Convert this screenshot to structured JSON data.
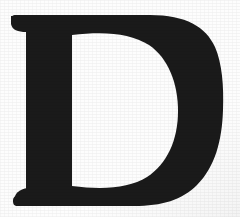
{
  "image": {
    "kind": "scanned-drop-cap",
    "character": "D",
    "description": "Large black serif capital letter D on a white page",
    "width": 240,
    "height": 217
  },
  "colors": {
    "ink": "#1a1a1a",
    "ink_edge": "#2a2a2a",
    "paper": "#fdfdfd",
    "paper_edge": "#f4f4f4"
  },
  "glyph": {
    "letter": "D",
    "style": "didone-serif-drop-cap",
    "stem": {
      "left": 26,
      "right": 72,
      "width": 46
    },
    "top_arm": {
      "top": 14,
      "left": 11,
      "right": 186
    },
    "bottom_arm": {
      "bottom": 206,
      "left": 14,
      "right": 186
    },
    "bowl": {
      "right_extent": 223
    },
    "counter": {
      "left": 72,
      "right": 178,
      "top": 33,
      "bottom": 188
    }
  }
}
